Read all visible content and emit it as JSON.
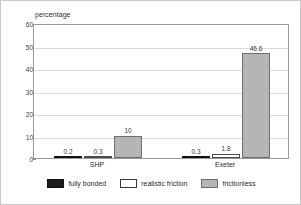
{
  "chart_data": {
    "type": "bar",
    "title": "",
    "subtitle": "",
    "xlabel": "",
    "ylabel": "percentage",
    "ylim": [
      0,
      60
    ],
    "yticks": [
      0,
      10,
      20,
      30,
      40,
      50,
      60
    ],
    "grid": true,
    "legend_position": "bottom",
    "categories": [
      "SHP",
      "Exeter"
    ],
    "series": [
      {
        "name": "fully bonded",
        "color": "#1c1c1c",
        "values": [
          0.2,
          0.3
        ],
        "labels": [
          "0.2",
          "0.3"
        ]
      },
      {
        "name": "realistic friction",
        "color": "#ffffff",
        "values": [
          0.3,
          1.8
        ],
        "labels": [
          "0.3",
          "1.8"
        ]
      },
      {
        "name": "frictionless",
        "color": "#b5b5b5",
        "values": [
          10,
          46.6
        ],
        "labels": [
          "10",
          "46.6"
        ]
      }
    ]
  },
  "colors": {
    "fully_bonded": "#1c1c1c",
    "realistic_friction": "#ffffff",
    "frictionless": "#b5b5b5",
    "gridline": "#dcdcdc",
    "axis": "#9a9a9a",
    "text": "#2b2b2b",
    "background": "#ffffff",
    "figure_border": "#c9c9c9"
  }
}
